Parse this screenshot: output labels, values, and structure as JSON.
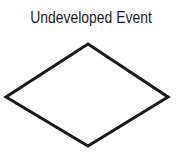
{
  "diagram": {
    "title": "Undeveloped Event",
    "symbol": {
      "shape": "diamond",
      "stroke_color": "#1a1a1a",
      "fill_color": "#ffffff",
      "points": [
        [
          88,
          44
        ],
        [
          168,
          97
        ],
        [
          88,
          146
        ],
        [
          6,
          97
        ]
      ]
    }
  }
}
